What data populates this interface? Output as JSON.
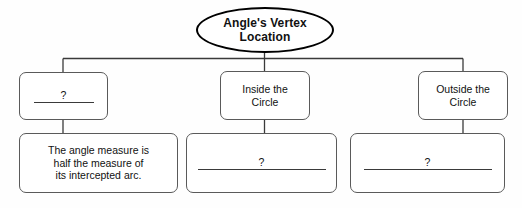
{
  "diagram": {
    "title_node": {
      "name": "angles-vertex-location",
      "lines": [
        "Angle's Vertex",
        "Location"
      ]
    },
    "row1": [
      {
        "name": "unknown-vertex-location",
        "type": "blank",
        "placeholder_mark": "?",
        "lines": []
      },
      {
        "name": "inside-the-circle",
        "type": "text",
        "lines": [
          "Inside the",
          "Circle"
        ]
      },
      {
        "name": "outside-the-circle",
        "type": "text",
        "lines": [
          "Outside the",
          "Circle"
        ]
      }
    ],
    "row2": [
      {
        "name": "angle-measure-rule",
        "type": "text",
        "lines": [
          "The angle measure is",
          "half the measure of",
          "its intercepted arc."
        ]
      },
      {
        "name": "inside-circle-rule-blank",
        "type": "blank",
        "placeholder_mark": "?",
        "lines": []
      },
      {
        "name": "outside-circle-rule-blank",
        "type": "blank",
        "placeholder_mark": "?",
        "lines": []
      }
    ],
    "colors": {
      "box_stroke": "#5a5a5a",
      "ellipse_stroke": "#000000",
      "connector": "#3a3a3a",
      "text": "#111111",
      "background": "#fefefe"
    }
  }
}
